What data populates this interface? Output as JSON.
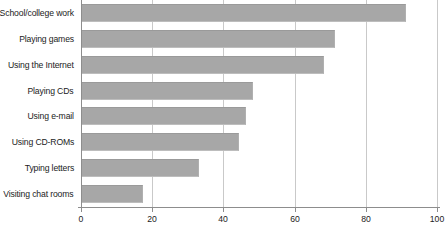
{
  "chart_data": {
    "type": "bar",
    "orientation": "horizontal",
    "title": "",
    "subtitle": "",
    "xlabel": "",
    "ylabel": "",
    "categories": [
      "School/college work",
      "Playing games",
      "Using the Internet",
      "Playing CDs",
      "Using e-mail",
      "Using CD-ROMs",
      "Typing letters",
      "Visiting chat rooms"
    ],
    "values": [
      91,
      71,
      68,
      48,
      46,
      44,
      33,
      17
    ],
    "xlim": [
      0,
      100
    ],
    "xticks": [
      0,
      20,
      40,
      60,
      80,
      100
    ],
    "xtick_labels": [
      "0",
      "20",
      "40",
      "60",
      "80",
      "100"
    ],
    "grid": "vertical",
    "legend": "none",
    "bar_color": "#a7a7a7",
    "grid_color": "#c9c9c9",
    "axis_color": "#8d8d8d",
    "text_color": "#1b1b1b"
  }
}
